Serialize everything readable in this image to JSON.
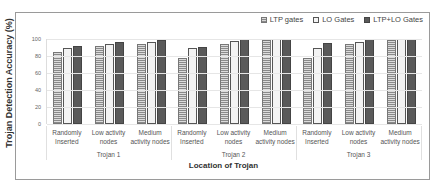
{
  "chart_data": {
    "type": "bar",
    "title": "",
    "xlabel": "Location of Trojan",
    "ylabel": "Trojan Detection Accuracy (%)",
    "ylim": [
      0,
      100
    ],
    "yticks": [
      0,
      20,
      40,
      60,
      80,
      100
    ],
    "grid": true,
    "legend_position": "top-right",
    "groups": [
      "Trojan 1",
      "Trojan 2",
      "Trojan 3"
    ],
    "categories": [
      "Randomly Inserted",
      "Low activity nodes",
      "Medium activity nodes",
      "Randomly Inserted",
      "Low activity nodes",
      "Medium activity nodes",
      "Randomly Inserted",
      "Low activity nodes",
      "Medium activity nodes"
    ],
    "series": [
      {
        "name": "LTP gates",
        "values": [
          85,
          92,
          94,
          78,
          94,
          99,
          78,
          94,
          99
        ]
      },
      {
        "name": "LO  Gates",
        "values": [
          90,
          94,
          96,
          89,
          98,
          100,
          89,
          97,
          100
        ]
      },
      {
        "name": "LTP+LO Gates",
        "values": [
          92,
          96,
          99,
          91,
          100,
          100,
          95,
          100,
          100
        ]
      }
    ]
  },
  "legend": {
    "ltp": "LTP gates",
    "lo": "LO  Gates",
    "both": "LTP+LO Gates"
  },
  "axis": {
    "ylabel": "Trojan Detection Accuracy (%)",
    "xlabel": "Location of Trojan",
    "yticks": [
      "0",
      "20",
      "40",
      "60",
      "80",
      "100"
    ]
  },
  "categories": [
    {
      "l1": "Randomly",
      "l2": "Inserted"
    },
    {
      "l1": "Low activity",
      "l2": "nodes"
    },
    {
      "l1": "Medium",
      "l2": "activity nodes"
    },
    {
      "l1": "Randomly",
      "l2": "Inserted"
    },
    {
      "l1": "Low activity",
      "l2": "nodes"
    },
    {
      "l1": "Medium",
      "l2": "activity nodes"
    },
    {
      "l1": "Randomly",
      "l2": "Inserted"
    },
    {
      "l1": "Low activity",
      "l2": "nodes"
    },
    {
      "l1": "Medium",
      "l2": "activity nodes"
    }
  ],
  "groups": [
    "Trojan 1",
    "Trojan 2",
    "Trojan 3"
  ]
}
